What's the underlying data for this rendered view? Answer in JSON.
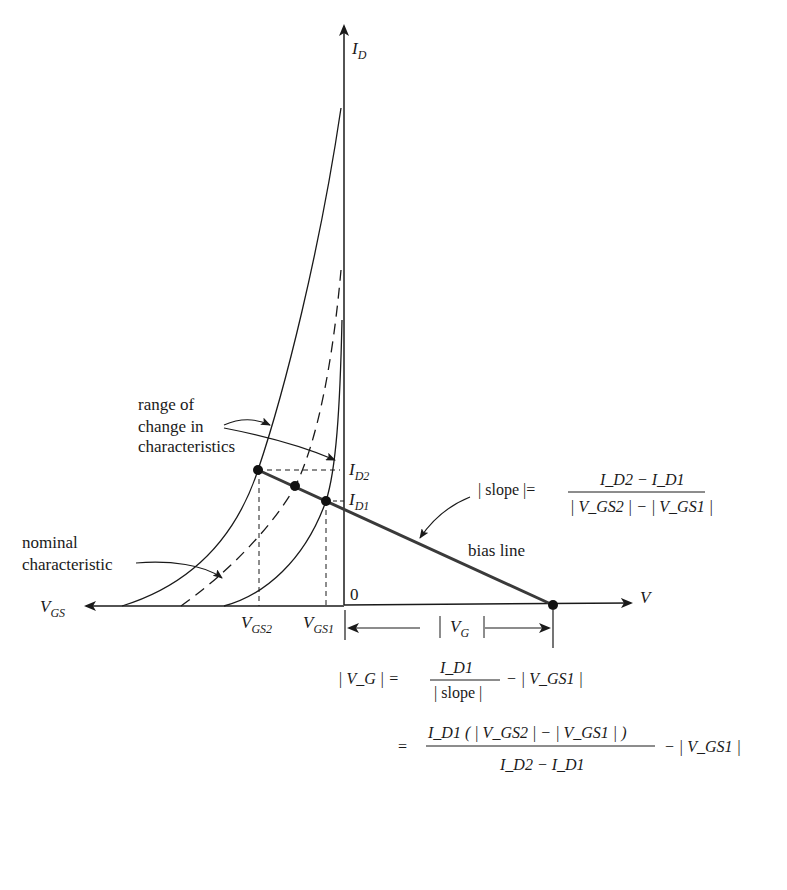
{
  "figure": {
    "type": "JFET bias-line diagram",
    "axes": {
      "y_axis_label": {
        "main": "I",
        "sub": "D"
      },
      "x_axis_left_label": {
        "main": "V",
        "sub": "GS"
      },
      "x_axis_right_label": "V",
      "origin_label": "0"
    },
    "current_labels": {
      "id2": {
        "main": "I",
        "sub": "D2"
      },
      "id1": {
        "main": "I",
        "sub": "D1"
      }
    },
    "voltage_labels": {
      "vgs2": {
        "main": "V",
        "sub": "GS2"
      },
      "vgs1": {
        "main": "V",
        "sub": "GS1"
      },
      "vg": {
        "main": "V",
        "sub": "G"
      }
    },
    "annotations": {
      "range_line1": "range of",
      "range_line2": "change in",
      "range_line3": "characteristics",
      "nominal_line1": "nominal",
      "nominal_line2": "characteristic",
      "bias_line": "bias line"
    },
    "slope_equation": {
      "lhs": "| slope |=",
      "numerator": "I_D2 − I_D1",
      "denominator": "| V_GS2 | − | V_GS1 |"
    },
    "vg_equation": {
      "line1_lhs": "| V_G | =",
      "line1_frac_num": "I_D1",
      "line1_frac_den": "| slope |",
      "line1_tail": "− | V_GS1 |",
      "line2_eq": "=",
      "line2_frac_num": "I_D1 ( | V_GS2 | − | V_GS1 | )",
      "line2_frac_den": "I_D2 − I_D1",
      "line2_tail": "− | V_GS1 |"
    },
    "colors": {
      "ink": "#1a1a1a",
      "bias_line": "#3a3a3a",
      "background": "#ffffff"
    }
  }
}
